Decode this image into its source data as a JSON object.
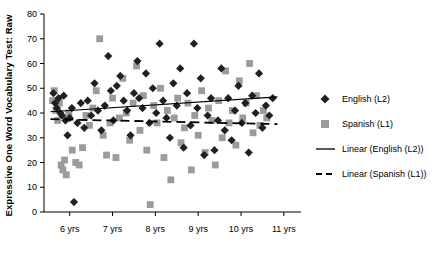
{
  "chart_data": {
    "type": "scatter",
    "title": "",
    "xlabel": "",
    "ylabel": "Expressive One Word Vocabulary Test: Raw",
    "xlim": [
      5.4,
      11.4
    ],
    "ylim": [
      0,
      80
    ],
    "grid": false,
    "xticks": [
      "6 yrs",
      "7 yrs",
      "8 yrs",
      "9 yrs",
      "10 yrs",
      "11 yrs"
    ],
    "xtick_values": [
      6,
      7,
      8,
      9,
      10,
      11
    ],
    "yticks": [
      "0",
      "10",
      "20",
      "30",
      "40",
      "50",
      "60",
      "70",
      "80"
    ],
    "ytick_values": [
      0,
      10,
      20,
      30,
      40,
      50,
      60,
      70,
      80
    ],
    "legend_position": "right",
    "legend": [
      {
        "label": "English (L2)",
        "marker": "diamond",
        "color": "#231f20"
      },
      {
        "label": "Spanish (L1)",
        "marker": "square",
        "color": "#9b9b9b"
      },
      {
        "label": "Linear (English (L2))",
        "marker": "line-solid",
        "color": "#000000"
      },
      {
        "label": "Linear (Spanish (L1))",
        "marker": "line-dashed",
        "color": "#000000"
      }
    ],
    "series": [
      {
        "name": "English (L2)",
        "marker": "diamond",
        "color": "#231f20",
        "points": [
          [
            5.62,
            48
          ],
          [
            5.66,
            44
          ],
          [
            5.7,
            42
          ],
          [
            5.74,
            46
          ],
          [
            5.78,
            40
          ],
          [
            5.82,
            39
          ],
          [
            5.86,
            47
          ],
          [
            5.9,
            37
          ],
          [
            5.95,
            31
          ],
          [
            6.0,
            38
          ],
          [
            6.05,
            42
          ],
          [
            6.1,
            4
          ],
          [
            6.18,
            36
          ],
          [
            6.26,
            44
          ],
          [
            6.34,
            34
          ],
          [
            6.42,
            45
          ],
          [
            6.5,
            39
          ],
          [
            6.58,
            52
          ],
          [
            6.66,
            41
          ],
          [
            6.74,
            33
          ],
          [
            6.82,
            43
          ],
          [
            6.9,
            63
          ],
          [
            6.96,
            49
          ],
          [
            7.02,
            37
          ],
          [
            7.1,
            51
          ],
          [
            7.18,
            55
          ],
          [
            7.26,
            45
          ],
          [
            7.34,
            41
          ],
          [
            7.42,
            31
          ],
          [
            7.5,
            48
          ],
          [
            7.58,
            61
          ],
          [
            7.62,
            46
          ],
          [
            7.7,
            42
          ],
          [
            7.78,
            56
          ],
          [
            7.86,
            36
          ],
          [
            7.94,
            50
          ],
          [
            8.02,
            40
          ],
          [
            8.1,
            68
          ],
          [
            8.18,
            45
          ],
          [
            8.26,
            38
          ],
          [
            8.34,
            30
          ],
          [
            8.42,
            52
          ],
          [
            8.5,
            43
          ],
          [
            8.58,
            58
          ],
          [
            8.66,
            26
          ],
          [
            8.74,
            48
          ],
          [
            8.82,
            35
          ],
          [
            8.9,
            68
          ],
          [
            8.98,
            42
          ],
          [
            9.06,
            54
          ],
          [
            9.14,
            23
          ],
          [
            9.22,
            39
          ],
          [
            9.3,
            46
          ],
          [
            9.38,
            25
          ],
          [
            9.46,
            37
          ],
          [
            9.54,
            58
          ],
          [
            9.62,
            33
          ],
          [
            9.7,
            46
          ],
          [
            9.78,
            29
          ],
          [
            9.86,
            41
          ],
          [
            9.94,
            51
          ],
          [
            10.02,
            36
          ],
          [
            10.1,
            44
          ],
          [
            10.18,
            24
          ],
          [
            10.26,
            47
          ],
          [
            10.34,
            40
          ],
          [
            10.42,
            56
          ],
          [
            10.5,
            34
          ],
          [
            10.58,
            43
          ],
          [
            10.66,
            39
          ],
          [
            10.74,
            46
          ]
        ]
      },
      {
        "name": "Spanish (L1)",
        "marker": "square",
        "color": "#9b9b9b",
        "points": [
          [
            5.6,
            45
          ],
          [
            5.64,
            49
          ],
          [
            5.68,
            41
          ],
          [
            5.72,
            37
          ],
          [
            5.76,
            44
          ],
          [
            5.8,
            19
          ],
          [
            5.84,
            17
          ],
          [
            5.88,
            21
          ],
          [
            5.92,
            15
          ],
          [
            5.98,
            40
          ],
          [
            6.06,
            25
          ],
          [
            6.14,
            20
          ],
          [
            6.22,
            19
          ],
          [
            6.3,
            26
          ],
          [
            6.38,
            39
          ],
          [
            6.46,
            35
          ],
          [
            6.54,
            42
          ],
          [
            6.62,
            49
          ],
          [
            6.7,
            70
          ],
          [
            6.78,
            31
          ],
          [
            6.86,
            23
          ],
          [
            6.94,
            36
          ],
          [
            7.0,
            46
          ],
          [
            7.08,
            22
          ],
          [
            7.16,
            38
          ],
          [
            7.24,
            54
          ],
          [
            7.32,
            40
          ],
          [
            7.4,
            29
          ],
          [
            7.48,
            44
          ],
          [
            7.56,
            59
          ],
          [
            7.64,
            33
          ],
          [
            7.72,
            47
          ],
          [
            7.8,
            25
          ],
          [
            7.88,
            3
          ],
          [
            7.96,
            43
          ],
          [
            8.04,
            36
          ],
          [
            8.12,
            50
          ],
          [
            8.2,
            22
          ],
          [
            8.28,
            41
          ],
          [
            8.36,
            13
          ],
          [
            8.44,
            38
          ],
          [
            8.52,
            46
          ],
          [
            8.6,
            28
          ],
          [
            8.68,
            34
          ],
          [
            8.76,
            44
          ],
          [
            8.84,
            17
          ],
          [
            8.92,
            39
          ],
          [
            9.0,
            31
          ],
          [
            9.08,
            49
          ],
          [
            9.16,
            24
          ],
          [
            9.24,
            42
          ],
          [
            9.32,
            37
          ],
          [
            9.4,
            19
          ],
          [
            9.48,
            45
          ],
          [
            9.56,
            30
          ],
          [
            9.64,
            57
          ],
          [
            9.72,
            36
          ],
          [
            9.8,
            41
          ],
          [
            9.88,
            27
          ],
          [
            9.96,
            53
          ],
          [
            10.04,
            38
          ],
          [
            10.12,
            44
          ],
          [
            10.2,
            60
          ],
          [
            10.28,
            32
          ],
          [
            10.36,
            47
          ],
          [
            10.44,
            35
          ],
          [
            10.52,
            41
          ],
          [
            10.6,
            38
          ]
        ]
      }
    ],
    "trendlines": [
      {
        "name": "Linear (English (L2))",
        "style": "solid",
        "color": "#000000",
        "x": [
          5.55,
          10.85
        ],
        "y": [
          40.5,
          46.5
        ]
      },
      {
        "name": "Linear (Spanish (L1))",
        "style": "dashed",
        "color": "#000000",
        "x": [
          5.55,
          10.85
        ],
        "y": [
          37.5,
          35.5
        ]
      }
    ]
  }
}
